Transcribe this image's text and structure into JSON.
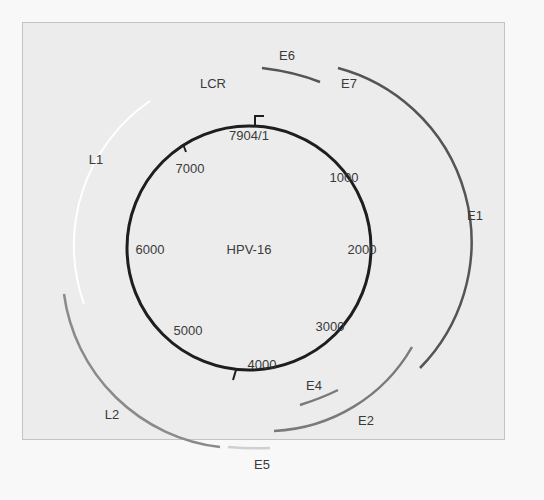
{
  "figure": {
    "title": "HPV-16",
    "genome_start_label": "7904/1",
    "position_labels": [
      {
        "text": "7904/1",
        "x": 249,
        "y": 140
      },
      {
        "text": "1000",
        "x": 344,
        "y": 182
      },
      {
        "text": "2000",
        "x": 362,
        "y": 254
      },
      {
        "text": "3000",
        "x": 330,
        "y": 331
      },
      {
        "text": "4000",
        "x": 262,
        "y": 369
      },
      {
        "text": "5000",
        "x": 188,
        "y": 335
      },
      {
        "text": "6000",
        "x": 150,
        "y": 254
      },
      {
        "text": "7000",
        "x": 190,
        "y": 173
      }
    ],
    "genes": [
      {
        "name": "E6",
        "label_x": 287,
        "label_y": 60
      },
      {
        "name": "E7",
        "label_x": 349,
        "label_y": 88
      },
      {
        "name": "E1",
        "label_x": 475,
        "label_y": 220
      },
      {
        "name": "E2",
        "label_x": 366,
        "label_y": 425
      },
      {
        "name": "E4",
        "label_x": 314,
        "label_y": 390
      },
      {
        "name": "E5",
        "label_x": 262,
        "label_y": 469
      },
      {
        "name": "L2",
        "label_x": 112,
        "label_y": 419
      },
      {
        "name": "L1",
        "label_x": 96,
        "label_y": 164
      },
      {
        "name": "LCR",
        "label_x": 213,
        "label_y": 88
      }
    ],
    "colors": {
      "background": "#ececec",
      "frame_border": "#c4c4c4",
      "genome_circle": "#1e1e1e",
      "early_genes": "#555555",
      "e2_e4": "#7a7a7a",
      "l2": "#8a8a8a",
      "l1": "#ffffff",
      "e5": "#d0d0d0",
      "text": "#3a3a3a"
    }
  }
}
